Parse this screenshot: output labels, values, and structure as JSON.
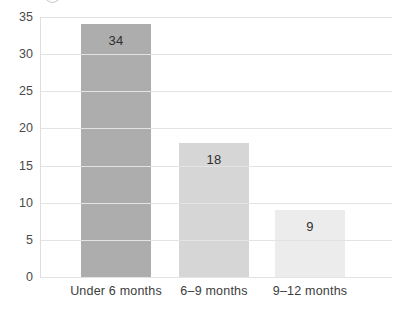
{
  "decoration": {
    "icon": "cropped-circle"
  },
  "chart_data": {
    "type": "bar",
    "title": "",
    "xlabel": "",
    "ylabel": "",
    "categories": [
      "Under 6 months",
      "6–9 months",
      "9–12 months"
    ],
    "values": [
      34,
      18,
      9
    ],
    "value_labels": [
      "34",
      "18",
      "9"
    ],
    "bar_colors": [
      "#adadad",
      "#d6d6d6",
      "#ececec"
    ],
    "ylim": [
      0,
      35
    ],
    "yticks": [
      0,
      5,
      10,
      15,
      20,
      25,
      30,
      35
    ],
    "grid": true,
    "legend": "none",
    "gridline_color": "#e3e3e3",
    "axis_line_color": "#dedede",
    "tick_label_color": "#4a4a4a",
    "value_label_color": "#2e2e2e",
    "background_color": "#ffffff"
  }
}
